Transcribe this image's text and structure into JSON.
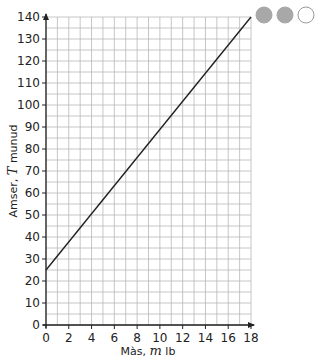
{
  "chart_data": {
    "type": "line",
    "title": "",
    "xlabel": "Màs, m lb",
    "ylabel": "Amser, T munud",
    "xlabel_parts": {
      "pre": "Màs, ",
      "var": "m",
      "post": " lb"
    },
    "ylabel_parts": {
      "pre": "Amser, ",
      "var": "T",
      "post": " munud"
    },
    "xlim": [
      0,
      18
    ],
    "ylim": [
      0,
      140
    ],
    "x_ticks": [
      "0",
      "2",
      "4",
      "6",
      "8",
      "10",
      "12",
      "14",
      "16",
      "18"
    ],
    "y_ticks": [
      "0",
      "10",
      "20",
      "30",
      "40",
      "50",
      "60",
      "70",
      "80",
      "90",
      "100",
      "110",
      "120",
      "130",
      "140"
    ],
    "grid": true,
    "grid_minor_x": 1,
    "grid_minor_y": 5,
    "series": [
      {
        "name": "T vs m",
        "x": [
          0,
          18
        ],
        "y": [
          25,
          140
        ]
      }
    ],
    "legend": null
  },
  "difficulty_indicator": {
    "filled": 2,
    "total": 3,
    "colors": {
      "filled": "#a8a8a8",
      "empty": "#ffffff",
      "outline": "#9a9a9a"
    }
  },
  "colors": {
    "grid": "#b8b8b8",
    "axis": "#222222",
    "line": "#222222"
  }
}
